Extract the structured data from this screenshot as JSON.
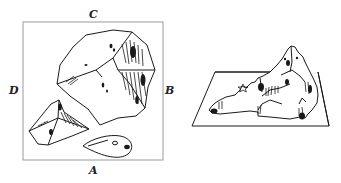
{
  "figure": {
    "left_panel": {
      "description": "Top-down plan view of terrain inside a square frame",
      "labels": {
        "top": "C",
        "right": "B",
        "bottom": "A",
        "left": "D"
      }
    },
    "right_panel": {
      "description": "Perspective 3D view of the same terrain on a flat base"
    },
    "colors": {
      "ink": "#1a1a1a",
      "frame": "#9a9a9a",
      "background": "#ffffff"
    }
  }
}
